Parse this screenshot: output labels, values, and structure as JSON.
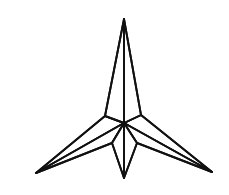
{
  "image": {
    "title": "Three-pointed star wireframe line drawing",
    "background_color": "#ffffff",
    "stroke_color": "#111111",
    "stroke_width_px": 1.9,
    "width_px": 229,
    "height_px": 195,
    "style": "black ink line art, white fill, no shading, no text labels"
  },
  "figure": {
    "name": "three-pointed-star-polyhedron",
    "description": "A wireframe polyhedral star with three long sharp spikes (one pointing up, one to the lower left, one to the lower right) plus one short spike pointing straight down, all meeting at a central hub.",
    "spike_count_long": 3,
    "spike_count_short": 1,
    "vertices": {
      "apex_top": [
        124,
        19
      ],
      "tip_left": [
        36,
        173
      ],
      "tip_right": [
        212,
        172
      ],
      "tip_bottom": [
        124,
        178
      ],
      "hub_center": [
        124,
        123
      ],
      "shoulder_left": [
        105,
        116
      ],
      "shoulder_right": [
        141,
        115
      ],
      "ridge_bottom_left": [
        112,
        143
      ],
      "ridge_bottom_right": [
        137,
        143
      ]
    },
    "edges": [
      {
        "name": "top-spike-left-edge",
        "from": "apex_top",
        "to": "shoulder_left"
      },
      {
        "name": "top-spike-right-edge",
        "from": "apex_top",
        "to": "shoulder_right"
      },
      {
        "name": "top-spike-center-ridge",
        "from": "apex_top",
        "to": "hub_center"
      },
      {
        "name": "left-spike-upper-edge",
        "from": "shoulder_left",
        "to": "tip_left"
      },
      {
        "name": "left-spike-center-ridge",
        "from": "hub_center",
        "to": "tip_left"
      },
      {
        "name": "left-spike-lower-edge",
        "from": "ridge_bottom_left",
        "to": "tip_left"
      },
      {
        "name": "right-spike-upper-edge",
        "from": "shoulder_right",
        "to": "tip_right"
      },
      {
        "name": "right-spike-center-ridge",
        "from": "hub_center",
        "to": "tip_right"
      },
      {
        "name": "right-spike-lower-edge",
        "from": "ridge_bottom_right",
        "to": "tip_right"
      },
      {
        "name": "bottom-spike-left-edge",
        "from": "ridge_bottom_left",
        "to": "tip_bottom"
      },
      {
        "name": "bottom-spike-right-edge",
        "from": "ridge_bottom_right",
        "to": "tip_bottom"
      },
      {
        "name": "bottom-spike-center-ridge",
        "from": "hub_center",
        "to": "tip_bottom"
      },
      {
        "name": "hub-edge-left",
        "from": "hub_center",
        "to": "shoulder_left"
      },
      {
        "name": "hub-edge-right",
        "from": "hub_center",
        "to": "shoulder_right"
      },
      {
        "name": "hub-edge-lower-left",
        "from": "hub_center",
        "to": "ridge_bottom_left"
      },
      {
        "name": "hub-edge-lower-right",
        "from": "hub_center",
        "to": "ridge_bottom_right"
      }
    ],
    "symmetry": "bilateral about the vertical axis at x = 124",
    "labels": [],
    "annotations": []
  }
}
